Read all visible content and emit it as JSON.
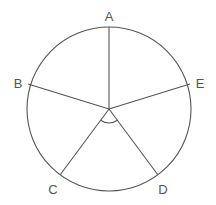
{
  "diagram": {
    "type": "circle-with-radii",
    "center": {
      "x": 109,
      "y": 109
    },
    "radius": 82,
    "stroke_color": "#555555",
    "points": [
      {
        "label": "A",
        "x": 109,
        "y": 27,
        "label_x": 109,
        "label_y": 21
      },
      {
        "label": "B",
        "x": 28,
        "y": 84,
        "label_x": 18,
        "label_y": 88
      },
      {
        "label": "C",
        "x": 60,
        "y": 175,
        "label_x": 53,
        "label_y": 194
      },
      {
        "label": "D",
        "x": 158,
        "y": 175,
        "label_x": 163,
        "label_y": 194
      },
      {
        "label": "E",
        "x": 190,
        "y": 84,
        "label_x": 200,
        "label_y": 88
      }
    ],
    "angle_marker": {
      "between": [
        "C",
        "D"
      ],
      "radius": 14
    }
  }
}
